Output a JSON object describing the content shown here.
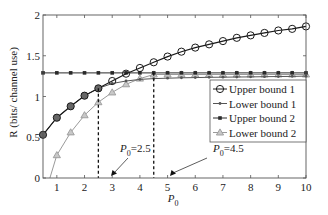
{
  "chart_data": {
    "type": "line",
    "title": "",
    "xlabel": "P_0",
    "ylabel": "R (bits/ channel use)",
    "xlim": [
      0.5,
      10
    ],
    "ylim": [
      0,
      2
    ],
    "xticks": [
      1,
      2,
      3,
      4,
      5,
      6,
      7,
      8,
      9,
      10
    ],
    "yticks": [
      0,
      0.5,
      1,
      1.5,
      2
    ],
    "ytick_labels": [
      "0",
      "0.5",
      "1",
      "1.5",
      "2"
    ],
    "grid": false,
    "legend_position": "center right",
    "series": [
      {
        "name": "Upper bound 1",
        "marker": "circle",
        "color": "#1a1a1a",
        "x": [
          0.5,
          1,
          1.5,
          2,
          2.5,
          3,
          3.5,
          4,
          4.5,
          5,
          5.5,
          6,
          6.5,
          7,
          7.5,
          8,
          8.5,
          9,
          9.5,
          10
        ],
        "y": [
          0.53,
          0.74,
          0.88,
          1.01,
          1.1,
          1.19,
          1.28,
          1.35,
          1.42,
          1.49,
          1.55,
          1.6,
          1.64,
          1.68,
          1.72,
          1.75,
          1.78,
          1.81,
          1.83,
          1.86
        ]
      },
      {
        "name": "Lower bound 1",
        "marker": "dot",
        "color": "#555555",
        "x": [
          0.5,
          1,
          1.5,
          2,
          2.5,
          3,
          3.5,
          4,
          4.5,
          5,
          5.5,
          6,
          6.5,
          7,
          7.5,
          8,
          8.5,
          9,
          9.5,
          10
        ],
        "y": [
          0.53,
          0.74,
          0.88,
          1.01,
          1.1,
          1.16,
          1.19,
          1.21,
          1.22,
          1.225,
          1.23,
          1.232,
          1.235,
          1.237,
          1.239,
          1.241,
          1.243,
          1.245,
          1.247,
          1.25
        ]
      },
      {
        "name": "Upper bound 2",
        "marker": "x-square",
        "color": "#2a2a2a",
        "x": [
          0.5,
          1,
          1.5,
          2,
          2.5,
          3,
          3.5,
          4,
          4.5,
          5,
          5.5,
          6,
          6.5,
          7,
          7.5,
          8,
          8.5,
          9,
          9.5,
          10
        ],
        "y": [
          1.29,
          1.29,
          1.29,
          1.29,
          1.29,
          1.29,
          1.29,
          1.29,
          1.29,
          1.29,
          1.29,
          1.29,
          1.29,
          1.29,
          1.29,
          1.29,
          1.29,
          1.29,
          1.29,
          1.29
        ]
      },
      {
        "name": "Lower bound 2",
        "marker": "triangle",
        "color": "#9a9a9a",
        "x": [
          0.75,
          1,
          1.5,
          2,
          2.5,
          3,
          3.5,
          4,
          4.5,
          5,
          5.5,
          6,
          6.5,
          7,
          7.5,
          8,
          8.5,
          9,
          9.5,
          10
        ],
        "y": [
          0.0,
          0.28,
          0.56,
          0.77,
          0.93,
          1.05,
          1.15,
          1.22,
          1.27,
          1.27,
          1.27,
          1.27,
          1.27,
          1.27,
          1.27,
          1.27,
          1.27,
          1.27,
          1.27,
          1.27
        ]
      }
    ],
    "annotations": [
      {
        "text_main": "P",
        "text_sub": "0",
        "text_rest": "=2.5",
        "x": 2.5,
        "y_from": 0,
        "y_to": 1.1
      },
      {
        "text_main": "P",
        "text_sub": "0",
        "text_rest": "=4.5",
        "x": 4.5,
        "y_from": 0,
        "y_to": 1.29
      }
    ]
  }
}
